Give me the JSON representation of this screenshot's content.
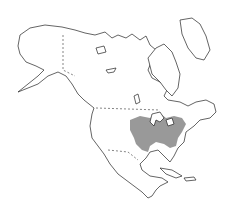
{
  "map": {
    "subject": "North America outline map",
    "highlighted_region": "Eastern United States range",
    "colors": {
      "background": "#ffffff",
      "outline": "#222222",
      "range_fill": "#999999"
    }
  }
}
